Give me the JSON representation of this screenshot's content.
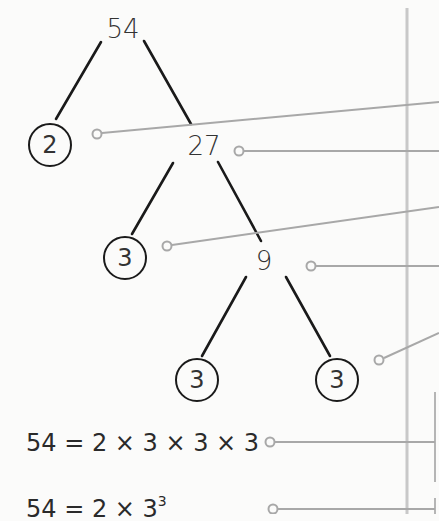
{
  "diagram": {
    "type": "factor-tree",
    "root": "54",
    "nodes": [
      {
        "id": "n54",
        "label": "54",
        "circled": false
      },
      {
        "id": "n2",
        "label": "2",
        "circled": true
      },
      {
        "id": "n27",
        "label": "27",
        "circled": false
      },
      {
        "id": "n3a",
        "label": "3",
        "circled": true
      },
      {
        "id": "n9",
        "label": "9",
        "circled": false
      },
      {
        "id": "n3b",
        "label": "3",
        "circled": true
      },
      {
        "id": "n3c",
        "label": "3",
        "circled": true
      }
    ],
    "edges": [
      [
        "n54",
        "n2"
      ],
      [
        "n54",
        "n27"
      ],
      [
        "n27",
        "n3a"
      ],
      [
        "n27",
        "n9"
      ],
      [
        "n9",
        "n3b"
      ],
      [
        "n9",
        "n3c"
      ]
    ],
    "equations": {
      "expanded": {
        "lhs": "54",
        "eq": "=",
        "rhs": "2 × 3 × 3 × 3"
      },
      "index": {
        "lhs": "54",
        "eq": "=",
        "base_text": "2 × 3",
        "exponent": "3"
      }
    },
    "colors": {
      "tree_line": "#1a1a1a",
      "leader_line": "#a8a8a8",
      "divider": "#c4c4c4",
      "text": "#333333"
    }
  }
}
